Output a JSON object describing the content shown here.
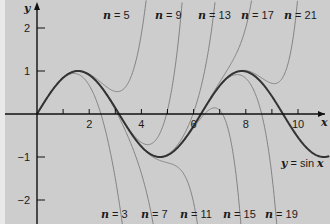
{
  "chart_data": {
    "type": "line",
    "title": "",
    "xlabel": "x",
    "ylabel": "y",
    "xlim": [
      0,
      11
    ],
    "ylim": [
      -2.5,
      2.5
    ],
    "xticks": [
      1,
      2,
      3,
      4,
      5,
      6,
      7,
      8,
      9,
      10
    ],
    "xtick_labels": [
      "2",
      "4",
      "6",
      "8",
      "10"
    ],
    "xtick_label_values": [
      2,
      4,
      6,
      8,
      10
    ],
    "yticks": [
      2,
      1,
      -1,
      -2
    ],
    "ytick_labels": [
      "2",
      "1",
      "−1",
      "−2"
    ],
    "grid": false,
    "background": "#cdcdcd",
    "main_series": {
      "name": "y = sin x",
      "label_parts": [
        "y",
        " = sin ",
        "x"
      ],
      "color": "#333333"
    },
    "taylor_series": [
      {
        "name": "n = 3",
        "n": 3,
        "label_position": "bottom"
      },
      {
        "name": "n = 5",
        "n": 5,
        "label_position": "top"
      },
      {
        "name": "n = 7",
        "n": 7,
        "label_position": "bottom"
      },
      {
        "name": "n = 9",
        "n": 9,
        "label_position": "top"
      },
      {
        "name": "n = 11",
        "n": 11,
        "label_position": "bottom"
      },
      {
        "name": "n = 13",
        "n": 13,
        "label_position": "top"
      },
      {
        "name": "n = 15",
        "n": 15,
        "label_position": "bottom"
      },
      {
        "name": "n = 17",
        "n": 17,
        "label_position": "top"
      },
      {
        "name": "n = 19",
        "n": 19,
        "label_position": "bottom"
      },
      {
        "name": "n = 21",
        "n": 21,
        "label_position": "top"
      }
    ],
    "annotations": {
      "top_labels": [
        {
          "text_n": "n",
          "text_val": " = 5",
          "x": 103
        },
        {
          "text_n": "n",
          "text_val": " = 9",
          "x": 155
        },
        {
          "text_n": "n",
          "text_val": " = 13",
          "x": 198
        },
        {
          "text_n": "n",
          "text_val": " = 17",
          "x": 241
        },
        {
          "text_n": "n",
          "text_val": " = 21",
          "x": 284
        }
      ],
      "bottom_labels": [
        {
          "text_n": "n",
          "text_val": " = 3",
          "x": 101
        },
        {
          "text_n": "n",
          "text_val": " = 7",
          "x": 141
        },
        {
          "text_n": "n",
          "text_val": " = 11",
          "x": 180
        },
        {
          "text_n": "n",
          "text_val": " = 15",
          "x": 223
        },
        {
          "text_n": "n",
          "text_val": " = 19",
          "x": 265
        }
      ]
    }
  }
}
